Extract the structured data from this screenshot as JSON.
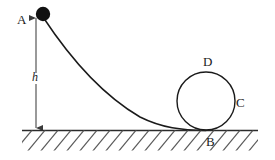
{
  "figure": {
    "type": "physics-diagram",
    "background_color": "#ffffff",
    "stroke_color": "#1a1a1a",
    "ball_color": "#111111",
    "labels": {
      "A": "A",
      "h": "h",
      "B": "B",
      "C": "C",
      "D": "D"
    },
    "elements": {
      "ball": {
        "name": "ball",
        "cx": 43,
        "cy": 14,
        "r": 7
      },
      "height_arrow": {
        "name": "height-dimension-arrow",
        "x": 36,
        "y_top": 16,
        "y_bottom": 130
      },
      "ground_line": {
        "name": "ground-line",
        "x_start": 22,
        "x_end": 258,
        "y": 130
      },
      "hatching": {
        "name": "ground-hatching",
        "spacing": 13,
        "angle_deg": 45,
        "depth": 19
      },
      "ramp_curve": {
        "name": "ramp-curve",
        "start_x": 43,
        "start_y": 17,
        "end_x": 205,
        "end_y": 130
      },
      "loop_circle": {
        "name": "loop-circle",
        "cx": 206,
        "cy": 101,
        "r": 29
      }
    }
  }
}
